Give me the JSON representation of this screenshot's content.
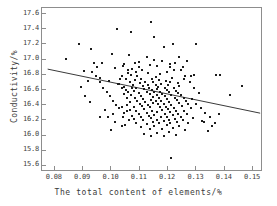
{
  "chart_data": {
    "type": "scatter",
    "title": "",
    "xlabel": "The total content of elements/%",
    "ylabel": "Conductivity/%",
    "xlim": [
      0.0755,
      0.1535
    ],
    "ylim": [
      15.52,
      17.68
    ],
    "xticks": [
      0.08,
      0.09,
      0.1,
      0.11,
      0.12,
      0.13,
      0.14,
      0.15
    ],
    "xtick_labels": [
      "0.08",
      "0.09",
      "0.10",
      "0.11",
      "0.12",
      "0.13",
      "0.14",
      "0.15"
    ],
    "yticks": [
      15.6,
      15.8,
      16.0,
      16.2,
      16.4,
      16.6,
      16.8,
      17.0,
      17.2,
      17.4,
      17.6
    ],
    "ytick_labels": [
      "15.6",
      "15.8",
      "16.0",
      "16.2",
      "16.4",
      "16.6",
      "16.8",
      "17.0",
      "17.2",
      "17.4",
      "17.6"
    ],
    "grid": false,
    "legend": null,
    "marker": "square",
    "marker_color": "#1c1c1c",
    "frame_color": "#8d8d8d",
    "trendline": {
      "type": "linear",
      "color": "#3a3a3a",
      "x_start": 0.0775,
      "y_start": 16.875,
      "x_end": 0.1525,
      "y_end": 16.295
    },
    "points": [
      [
        0.114,
        17.49
      ],
      [
        0.1018,
        17.41
      ],
      [
        0.1068,
        17.37
      ],
      [
        0.1152,
        17.3
      ],
      [
        0.0885,
        17.21
      ],
      [
        0.1216,
        17.2
      ],
      [
        0.13,
        17.2
      ],
      [
        0.1186,
        17.17
      ],
      [
        0.0929,
        17.14
      ],
      [
        0.1002,
        17.08
      ],
      [
        0.1063,
        17.06
      ],
      [
        0.1126,
        17.04
      ],
      [
        0.084,
        17.01
      ],
      [
        0.115,
        16.99
      ],
      [
        0.118,
        16.98
      ],
      [
        0.1096,
        16.97
      ],
      [
        0.1226,
        16.96
      ],
      [
        0.0968,
        16.95
      ],
      [
        0.1043,
        16.94
      ],
      [
        0.1136,
        16.93
      ],
      [
        0.1162,
        16.92
      ],
      [
        0.1205,
        16.9
      ],
      [
        0.1012,
        16.89
      ],
      [
        0.1073,
        16.88
      ],
      [
        0.1108,
        16.87
      ],
      [
        0.1246,
        16.86
      ],
      [
        0.0902,
        16.85
      ],
      [
        0.1196,
        16.84
      ],
      [
        0.1057,
        16.83
      ],
      [
        0.113,
        16.82
      ],
      [
        0.1172,
        16.81
      ],
      [
        0.137,
        16.8
      ],
      [
        0.129,
        16.8
      ],
      [
        0.128,
        16.79
      ],
      [
        0.0946,
        16.79
      ],
      [
        0.1092,
        16.78
      ],
      [
        0.1036,
        16.78
      ],
      [
        0.1158,
        16.77
      ],
      [
        0.1215,
        16.76
      ],
      [
        0.0958,
        16.76
      ],
      [
        0.1104,
        16.75
      ],
      [
        0.1142,
        16.75
      ],
      [
        0.1255,
        16.74
      ],
      [
        0.103,
        16.74
      ],
      [
        0.1084,
        16.73
      ],
      [
        0.1168,
        16.73
      ],
      [
        0.1192,
        16.72
      ],
      [
        0.099,
        16.72
      ],
      [
        0.112,
        16.71
      ],
      [
        0.1148,
        16.71
      ],
      [
        0.1208,
        16.7
      ],
      [
        0.1064,
        16.7
      ],
      [
        0.1234,
        16.69
      ],
      [
        0.11,
        16.69
      ],
      [
        0.1176,
        16.68
      ],
      [
        0.1022,
        16.68
      ],
      [
        0.1128,
        16.67
      ],
      [
        0.1156,
        16.67
      ],
      [
        0.12,
        16.66
      ],
      [
        0.1076,
        16.66
      ],
      [
        0.124,
        16.65
      ],
      [
        0.1112,
        16.65
      ],
      [
        0.1164,
        16.64
      ],
      [
        0.1046,
        16.64
      ],
      [
        0.1188,
        16.63
      ],
      [
        0.1132,
        16.63
      ],
      [
        0.122,
        16.62
      ],
      [
        0.1088,
        16.62
      ],
      [
        0.116,
        16.61
      ],
      [
        0.1116,
        16.61
      ],
      [
        0.1196,
        16.6
      ],
      [
        0.1052,
        16.6
      ],
      [
        0.1144,
        16.6
      ],
      [
        0.1228,
        16.59
      ],
      [
        0.108,
        16.59
      ],
      [
        0.1172,
        16.58
      ],
      [
        0.1124,
        16.58
      ],
      [
        0.1204,
        16.57
      ],
      [
        0.106,
        16.57
      ],
      [
        0.1152,
        16.57
      ],
      [
        0.1236,
        16.56
      ],
      [
        0.1096,
        16.56
      ],
      [
        0.118,
        16.55
      ],
      [
        0.1136,
        16.55
      ],
      [
        0.1212,
        16.54
      ],
      [
        0.1068,
        16.54
      ],
      [
        0.116,
        16.53
      ],
      [
        0.1244,
        16.53
      ],
      [
        0.1104,
        16.52
      ],
      [
        0.1188,
        16.52
      ],
      [
        0.1148,
        16.51
      ],
      [
        0.1224,
        16.5
      ],
      [
        0.1084,
        16.5
      ],
      [
        0.1168,
        16.49
      ],
      [
        0.1256,
        16.49
      ],
      [
        0.1112,
        16.48
      ],
      [
        0.1196,
        16.48
      ],
      [
        0.114,
        16.47
      ],
      [
        0.1232,
        16.47
      ],
      [
        0.1092,
        16.46
      ],
      [
        0.1176,
        16.46
      ],
      [
        0.1156,
        16.45
      ],
      [
        0.1264,
        16.45
      ],
      [
        0.112,
        16.44
      ],
      [
        0.1204,
        16.44
      ],
      [
        0.1148,
        16.43
      ],
      [
        0.124,
        16.43
      ],
      [
        0.11,
        16.42
      ],
      [
        0.1184,
        16.42
      ],
      [
        0.1164,
        16.41
      ],
      [
        0.1272,
        16.41
      ],
      [
        0.1128,
        16.4
      ],
      [
        0.1212,
        16.4
      ],
      [
        0.1056,
        16.4
      ],
      [
        0.1248,
        16.39
      ],
      [
        0.1108,
        16.39
      ],
      [
        0.1192,
        16.38
      ],
      [
        0.1172,
        16.38
      ],
      [
        0.1036,
        16.37
      ],
      [
        0.1136,
        16.37
      ],
      [
        0.122,
        16.36
      ],
      [
        0.128,
        16.36
      ],
      [
        0.1116,
        16.35
      ],
      [
        0.12,
        16.35
      ],
      [
        0.1064,
        16.34
      ],
      [
        0.118,
        16.34
      ],
      [
        0.1256,
        16.33
      ],
      [
        0.1144,
        16.33
      ],
      [
        0.1228,
        16.32
      ],
      [
        0.1088,
        16.32
      ],
      [
        0.1208,
        16.31
      ],
      [
        0.116,
        16.31
      ],
      [
        0.1044,
        16.3
      ],
      [
        0.1124,
        16.3
      ],
      [
        0.1236,
        16.29
      ],
      [
        0.1188,
        16.29
      ],
      [
        0.1096,
        16.28
      ],
      [
        0.1268,
        16.28
      ],
      [
        0.1152,
        16.27
      ],
      [
        0.1216,
        16.27
      ],
      [
        0.1072,
        16.26
      ],
      [
        0.1132,
        16.26
      ],
      [
        0.1244,
        16.25
      ],
      [
        0.1196,
        16.25
      ],
      [
        0.1104,
        16.24
      ],
      [
        0.1176,
        16.24
      ],
      [
        0.1288,
        16.23
      ],
      [
        0.114,
        16.23
      ],
      [
        0.1224,
        16.22
      ],
      [
        0.108,
        16.22
      ],
      [
        0.1204,
        16.21
      ],
      [
        0.116,
        16.21
      ],
      [
        0.1252,
        16.2
      ],
      [
        0.1112,
        16.2
      ],
      [
        0.1184,
        16.19
      ],
      [
        0.132,
        16.19
      ],
      [
        0.1148,
        16.18
      ],
      [
        0.1232,
        16.18
      ],
      [
        0.1088,
        16.17
      ],
      [
        0.1208,
        16.17
      ],
      [
        0.1168,
        16.16
      ],
      [
        0.1272,
        16.16
      ],
      [
        0.1124,
        16.15
      ],
      [
        0.1196,
        16.14
      ],
      [
        0.124,
        16.13
      ],
      [
        0.1152,
        16.12
      ],
      [
        0.1104,
        16.11
      ],
      [
        0.1216,
        16.1
      ],
      [
        0.118,
        16.09
      ],
      [
        0.1136,
        16.08
      ],
      [
        0.126,
        16.07
      ],
      [
        0.1204,
        16.05
      ],
      [
        0.116,
        16.04
      ],
      [
        0.1116,
        16.02
      ],
      [
        0.1228,
        16.01
      ],
      [
        0.1184,
        16.0
      ],
      [
        0.114,
        15.99
      ],
      [
        0.121,
        15.7
      ],
      [
        0.0932,
        16.84
      ],
      [
        0.0944,
        16.78
      ],
      [
        0.0958,
        16.7
      ],
      [
        0.0972,
        16.62
      ],
      [
        0.0986,
        16.58
      ],
      [
        0.0996,
        16.52
      ],
      [
        0.1006,
        16.46
      ],
      [
        0.1016,
        16.4
      ],
      [
        0.1026,
        16.36
      ],
      [
        0.1004,
        16.29
      ],
      [
        0.0988,
        16.25
      ],
      [
        0.1014,
        16.18
      ],
      [
        0.1036,
        16.12
      ],
      [
        0.0998,
        16.07
      ],
      [
        0.0906,
        16.52
      ],
      [
        0.0924,
        16.44
      ],
      [
        0.1046,
        16.55
      ],
      [
        0.1056,
        16.5
      ],
      [
        0.1038,
        16.62
      ],
      [
        0.1028,
        16.68
      ],
      [
        0.105,
        16.74
      ],
      [
        0.107,
        16.8
      ],
      [
        0.106,
        16.86
      ],
      [
        0.104,
        16.92
      ],
      [
        0.1082,
        16.95
      ],
      [
        0.1098,
        16.9
      ],
      [
        0.1086,
        16.84
      ],
      [
        0.1074,
        16.62
      ],
      [
        0.1066,
        16.44
      ],
      [
        0.1078,
        16.38
      ],
      [
        0.1054,
        16.32
      ],
      [
        0.1042,
        16.24
      ],
      [
        0.1062,
        16.2
      ],
      [
        0.1048,
        16.14
      ],
      [
        0.126,
        16.78
      ],
      [
        0.1276,
        16.7
      ],
      [
        0.1292,
        16.62
      ],
      [
        0.1308,
        16.56
      ],
      [
        0.1284,
        16.48
      ],
      [
        0.13,
        16.42
      ],
      [
        0.1316,
        16.36
      ],
      [
        0.1332,
        16.3
      ],
      [
        0.1348,
        16.24
      ],
      [
        0.1328,
        16.18
      ],
      [
        0.1356,
        16.12
      ],
      [
        0.134,
        16.06
      ],
      [
        0.1364,
        16.16
      ],
      [
        0.138,
        16.28
      ],
      [
        0.142,
        16.54
      ],
      [
        0.1462,
        16.65
      ],
      [
        0.1384,
        16.8
      ],
      [
        0.1254,
        16.9
      ],
      [
        0.1268,
        16.98
      ],
      [
        0.1238,
        17.04
      ],
      [
        0.1222,
        16.86
      ],
      [
        0.1206,
        16.94
      ],
      [
        0.096,
        16.24
      ],
      [
        0.0976,
        16.34
      ],
      [
        0.095,
        16.9
      ],
      [
        0.0938,
        16.96
      ],
      [
        0.0918,
        16.72
      ],
      [
        0.0892,
        16.64
      ]
    ]
  }
}
